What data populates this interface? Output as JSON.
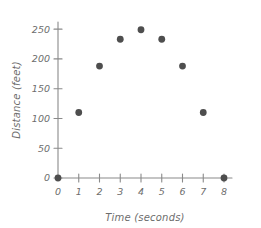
{
  "chart_data": {
    "type": "scatter",
    "title": "",
    "xlabel": "Time (seconds)",
    "ylabel": "Distance (feet)",
    "x": [
      0,
      1,
      2,
      3,
      4,
      5,
      6,
      7,
      8
    ],
    "values": [
      0,
      110,
      188,
      233,
      249,
      233,
      188,
      110,
      0
    ],
    "points": [
      {
        "x": 0,
        "y": 0
      },
      {
        "x": 1,
        "y": 110
      },
      {
        "x": 2,
        "y": 188
      },
      {
        "x": 3,
        "y": 233
      },
      {
        "x": 4,
        "y": 249
      },
      {
        "x": 5,
        "y": 233
      },
      {
        "x": 6,
        "y": 188
      },
      {
        "x": 7,
        "y": 110
      },
      {
        "x": 8,
        "y": 0
      }
    ],
    "xlim": [
      0,
      8
    ],
    "ylim": [
      0,
      262
    ],
    "xticks": [
      0,
      1,
      2,
      3,
      4,
      5,
      6,
      7,
      8
    ],
    "yticks": [
      0,
      50,
      100,
      150,
      200,
      250
    ],
    "xticklabels": [
      "0",
      "1",
      "2",
      "3",
      "4",
      "5",
      "6",
      "7",
      "8"
    ],
    "yticklabels": [
      "0",
      "50",
      "100",
      "150",
      "200",
      "250"
    ],
    "grid": false,
    "legend": null,
    "marker_color": "#4e4e4e",
    "axis_color": "#8a8a8a",
    "text_color": "#6d6d6d",
    "background": "#ffffff"
  }
}
